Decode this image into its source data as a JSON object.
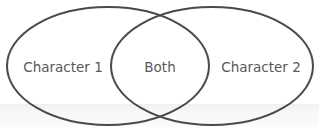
{
  "diagram": {
    "type": "venn",
    "sets": [
      {
        "id": "left",
        "label": "Character 1"
      },
      {
        "id": "right",
        "label": "Character 2"
      }
    ],
    "intersection": {
      "label": "Both"
    },
    "colors": {
      "stroke": "#4a4a4a",
      "text": "#585858",
      "background": "#ffffff"
    }
  }
}
